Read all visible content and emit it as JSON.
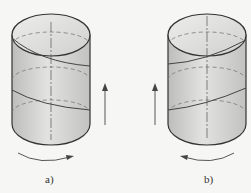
{
  "diagram": {
    "type": "helix-direction-illustration",
    "panels": [
      {
        "id": "a",
        "label": "a)",
        "helix": "right-hand",
        "rotation_arrow": "left-to-right",
        "axial_arrow": "up",
        "axial_arrow_side": "right"
      },
      {
        "id": "b",
        "label": "b)",
        "helix": "left-hand",
        "rotation_arrow": "right-to-left",
        "axial_arrow": "up",
        "axial_arrow_side": "left"
      }
    ],
    "colors": {
      "background": "#f6f6f4",
      "cylinder_fill": "#d4d4d2",
      "stroke": "#333333",
      "hidden_line": "#777777"
    }
  }
}
